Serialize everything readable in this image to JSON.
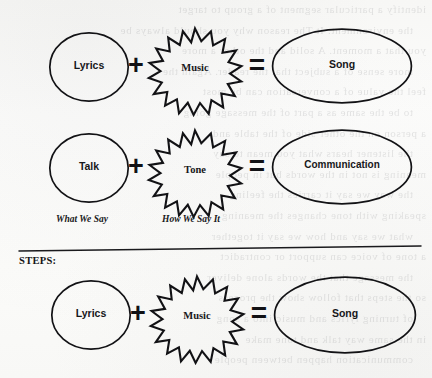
{
  "page": {
    "background_color": "#fbfbfa",
    "ink_color": "#121215",
    "ghost_text_note": "faint mirrored bleed-through text from reverse side of scanned page"
  },
  "ghost_text": {
    "lines": [
      "identify a particular segment of a group to target",
      "the environment. It The reason why you should always be",
      "you that a moment. A solid and the other a more",
      "more sense of a subject that the reader. Again the",
      "feel the value of a conversation can be most",
      "to be the same as a part of the message going",
      "a person on the other side of the table and",
      "the listener hears what you mean to say",
      "meaning is not in the words but in people",
      "the way we say it carries the feeling",
      "speaking with tone changes the meaning",
      "what we say and how we say it together",
      "a tone of voice can support or contradict",
      "the message that the words alone deliver",
      "so the steps that follow show the process",
      "of turning lyrics and music into a song",
      "in the same way talk and tone make",
      "communication happen between people"
    ]
  },
  "divider": {
    "name": "horizontal-rule",
    "x_start": 19,
    "x_end": 421,
    "y_left": 251,
    "y_right": 246
  },
  "steps": {
    "label": "STEPS:"
  },
  "rows": [
    {
      "id": "row-song",
      "term_a": {
        "shape": "circle",
        "label": "Lyrics"
      },
      "operator_1": "+",
      "term_b": {
        "shape": "starburst",
        "label": "Music",
        "points": 16
      },
      "operator_2": "=",
      "result": {
        "shape": "ellipse",
        "label": "Song"
      },
      "caption_a": "",
      "caption_b": ""
    },
    {
      "id": "row-communication",
      "term_a": {
        "shape": "circle",
        "label": "Talk"
      },
      "operator_1": "+",
      "term_b": {
        "shape": "starburst",
        "label": "Tone",
        "points": 16
      },
      "operator_2": "=",
      "result": {
        "shape": "ellipse",
        "label": "Communication"
      },
      "caption_a": "What We Say",
      "caption_b": "How We Say It"
    },
    {
      "id": "row-steps-song",
      "term_a": {
        "shape": "circle",
        "label": "Lyrics"
      },
      "operator_1": "+",
      "term_b": {
        "shape": "starburst",
        "label": "Music",
        "points": 16
      },
      "operator_2": "=",
      "result": {
        "shape": "ellipse",
        "label": "Song"
      },
      "caption_a": "",
      "caption_b": ""
    }
  ]
}
